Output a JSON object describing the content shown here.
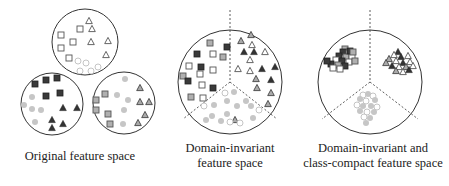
{
  "panels": [
    {
      "id": "original",
      "caption_lines": [
        "Original feature space"
      ],
      "circles": [
        {
          "cx": 85,
          "cy": 42,
          "r": 33
        },
        {
          "cx": 52,
          "cy": 104,
          "r": 31
        },
        {
          "cx": 124,
          "cy": 103,
          "r": 31
        }
      ]
    },
    {
      "id": "domain-invariant",
      "caption_lines": [
        "Domain-invariant",
        "feature space"
      ],
      "circle": {
        "cx": 230,
        "cy": 82,
        "r": 52
      }
    },
    {
      "id": "domain-invariant-class-compact",
      "caption_lines": [
        "Domain-invariant and",
        "class-compact feature space"
      ],
      "circle": {
        "cx": 370,
        "cy": 82,
        "r": 52
      }
    }
  ],
  "legend_shapes": {
    "square": "class-square",
    "triangle": "class-triangle",
    "circle": "class-circle"
  },
  "colors": {
    "dark_fill": "#3a3a3a",
    "gray_fill": "#a8a8a8",
    "light_fill": "#c8c8c8",
    "outline": "#444444",
    "hollow_stroke": "#777777",
    "light_stroke": "#bbbbbb"
  }
}
